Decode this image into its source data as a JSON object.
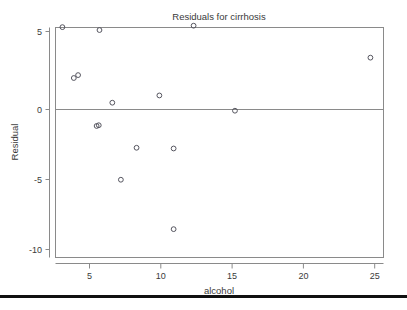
{
  "figure": {
    "name": "residual-scatter-plot",
    "background_color": "#ffffff",
    "frame_color": "#8a8a8a",
    "marker_color": "#55555f",
    "bottom_rule_color": "#101010"
  },
  "chart_data": {
    "type": "scatter",
    "title": "Residuals for cirrhosis",
    "xlabel": "alcohol",
    "ylabel": "Residual",
    "xlim": [
      2.6,
      25.6
    ],
    "ylim": [
      -10.6,
      5.9
    ],
    "xticks": [
      5,
      10,
      15,
      20,
      25
    ],
    "xtick_labels": [
      "5",
      "10",
      "15",
      "20",
      "25"
    ],
    "yticks": [
      5,
      0,
      -5,
      -10
    ],
    "ytick_labels": [
      "5",
      "0",
      "-5",
      "-10"
    ],
    "grid": false,
    "legend": false,
    "reference_line": {
      "orientation": "horizontal",
      "y": 0
    },
    "series": [
      {
        "name": "residuals",
        "marker": "open-circle",
        "points": [
          {
            "x": 3.1,
            "y": 5.3
          },
          {
            "x": 5.7,
            "y": 5.1
          },
          {
            "x": 12.3,
            "y": 5.4
          },
          {
            "x": 24.7,
            "y": 3.2
          },
          {
            "x": 3.9,
            "y": 1.8
          },
          {
            "x": 4.2,
            "y": 2.0
          },
          {
            "x": 9.9,
            "y": 0.6
          },
          {
            "x": 6.6,
            "y": 0.1
          },
          {
            "x": 15.2,
            "y": -0.45
          },
          {
            "x": 5.5,
            "y": -1.5
          },
          {
            "x": 5.65,
            "y": -1.45
          },
          {
            "x": 8.3,
            "y": -3.0
          },
          {
            "x": 10.9,
            "y": -3.05
          },
          {
            "x": 7.2,
            "y": -5.2
          },
          {
            "x": 10.9,
            "y": -8.6
          }
        ]
      }
    ]
  }
}
